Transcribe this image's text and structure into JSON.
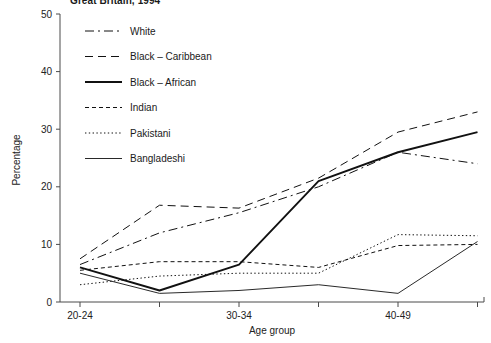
{
  "title": "Great Britain, 1994",
  "chart_data": {
    "type": "line",
    "title": "Great Britain, 1994",
    "xlabel": "Age group",
    "ylabel": "Percentage",
    "ylim": [
      0,
      50
    ],
    "yticks": [
      0,
      10,
      20,
      30,
      40,
      50
    ],
    "ytick_labels": [
      "0",
      "10",
      "20",
      "30",
      "40",
      "50"
    ],
    "grid": false,
    "legend_position": "upper-left-inside",
    "x": [
      "20-24",
      "25-29",
      "30-34",
      "35-39",
      "40-49",
      "50-59"
    ],
    "xtick_positions": [
      0,
      1,
      2,
      3,
      4,
      5
    ],
    "xtick_labels": [
      "20-24",
      "",
      "30-34",
      "",
      "40-49",
      ""
    ],
    "categories": [
      "20-24",
      "25-29",
      "30-34",
      "35-39",
      "40-49",
      "50-59"
    ],
    "series": [
      {
        "name": "White",
        "style": "dash-dot",
        "values": [
          6.5,
          12.0,
          15.5,
          20.0,
          26.0,
          24.0
        ]
      },
      {
        "name": "Black – Caribbean",
        "style": "dashed",
        "values": [
          7.5,
          16.8,
          16.3,
          21.5,
          29.5,
          33.0
        ]
      },
      {
        "name": "Black – African",
        "style": "solid-thick",
        "values": [
          6.0,
          2.0,
          6.5,
          21.0,
          26.0,
          29.5
        ]
      },
      {
        "name": "Indian",
        "style": "dash-short",
        "values": [
          5.5,
          7.0,
          7.0,
          6.0,
          9.8,
          10.0
        ]
      },
      {
        "name": "Pakistani",
        "style": "dotted",
        "values": [
          3.0,
          4.5,
          5.0,
          5.0,
          11.7,
          11.5
        ]
      },
      {
        "name": "Bangladeshi",
        "style": "solid-thin",
        "values": [
          5.0,
          1.5,
          2.0,
          3.0,
          1.5,
          10.5
        ]
      }
    ]
  },
  "legend": {
    "items": [
      {
        "label": "White",
        "style": "dash-dot"
      },
      {
        "label": "Black – Caribbean",
        "style": "dashed"
      },
      {
        "label": "Black – African",
        "style": "solid-thick"
      },
      {
        "label": "Indian",
        "style": "dash-short"
      },
      {
        "label": "Pakistani",
        "style": "dotted"
      },
      {
        "label": "Bangladeshi",
        "style": "solid-thin"
      }
    ]
  },
  "colors": {
    "ink": "#111111",
    "axis": "#4a4a4a",
    "background": "#ffffff"
  }
}
